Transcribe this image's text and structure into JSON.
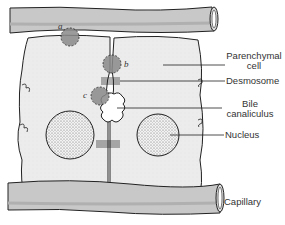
{
  "labels": {
    "parenchymal": [
      "Parenchymal",
      "cell"
    ],
    "desmosome": "Desmosome",
    "bile": [
      "Bile",
      "canaliculus"
    ],
    "nucleus": "Nucleus",
    "capillary": "Capillary"
  },
  "markers": {
    "a": "a",
    "b": "b",
    "c": "c"
  },
  "colors": {
    "cell_fill": "#efefef",
    "capillary_fill": "#c8c8c8",
    "outline": "#222222",
    "marker_fill": "#8a8a8a"
  }
}
